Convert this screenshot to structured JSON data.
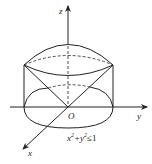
{
  "diagram": {
    "axes": {
      "z_label": "z",
      "y_label": "y",
      "x_label": "x",
      "origin_label": "O"
    },
    "region_label_base": "x",
    "region_label_mid": "+y",
    "region_label_end": "≤1",
    "region_label_sup": "2",
    "colors": {
      "stroke": "#222222",
      "background": "#ffffff"
    }
  }
}
